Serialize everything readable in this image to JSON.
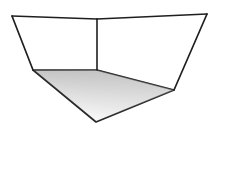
{
  "figure": {
    "canvas": {
      "width": 226,
      "height": 176,
      "background_color": "#ffffff"
    },
    "style": {
      "line_color": "#1f1f1f",
      "line_color_soft": "#3a3a3a",
      "line_width": 1.6,
      "floor_gradient_start": "#ffffff",
      "floor_gradient_mid": "#e3e3e3",
      "floor_gradient_end": "#b0b0b0",
      "floor_stroke": "#242424"
    },
    "vertices": {
      "top_left": {
        "x": 12,
        "y": 16,
        "label": "top-left ceiling corner"
      },
      "top_center": {
        "x": 97,
        "y": 19,
        "label": "top back corner"
      },
      "top_right": {
        "x": 207,
        "y": 14,
        "label": "top-right ceiling corner"
      },
      "floor_left": {
        "x": 33,
        "y": 70,
        "label": "left floor corner"
      },
      "floor_back": {
        "x": 97,
        "y": 70,
        "label": "back floor corner"
      },
      "floor_right": {
        "x": 174,
        "y": 90,
        "label": "right floor corner"
      },
      "floor_front": {
        "x": 96,
        "y": 122,
        "label": "front floor apex"
      }
    },
    "edges": [
      {
        "name": "ceiling-left-span",
        "points": "12,16 97,19"
      },
      {
        "name": "ceiling-right-span",
        "points": "97,19 207,14"
      },
      {
        "name": "left-wall-vertical",
        "points": "12,16 33,70"
      },
      {
        "name": "right-wall-vertical",
        "points": "207,14 174,90"
      },
      {
        "name": "back-corner-vertical",
        "points": "97,19 97,70"
      }
    ],
    "floor_polygon": {
      "name": "floor-plane",
      "points": "33,70 97,70 174,90 96,122"
    }
  }
}
